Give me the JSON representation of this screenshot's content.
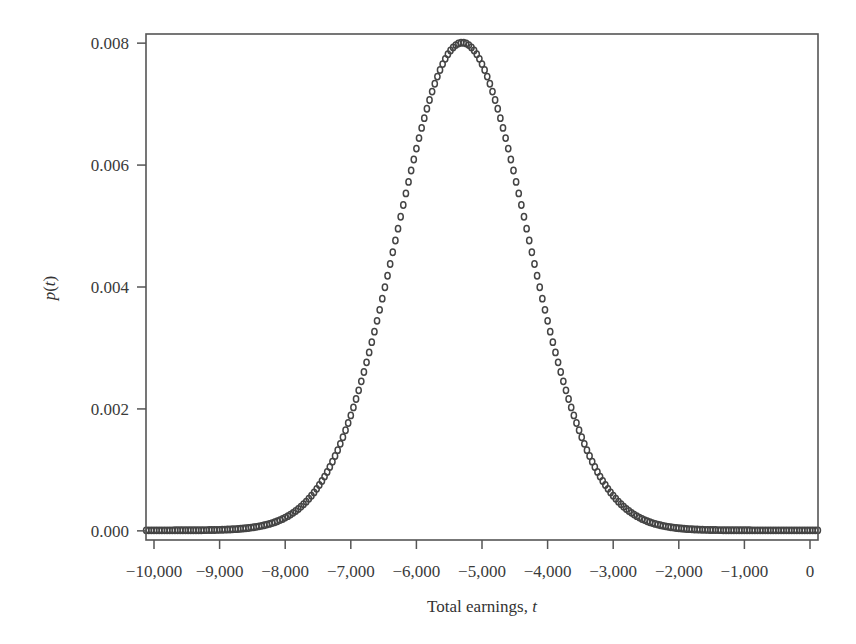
{
  "chart_data": {
    "type": "scatter",
    "title": "",
    "xlabel": "Total earnings, ",
    "xlabel_var": "t",
    "ylabel": "p(t)",
    "ylabel_parts": [
      "p",
      "(",
      "t",
      ")"
    ],
    "xlim": [
      -10122,
      122
    ],
    "ylim": [
      -0.00015,
      0.00815
    ],
    "x_ticks": [
      -10000,
      -9000,
      -8000,
      -7000,
      -6000,
      -5000,
      -4000,
      -3000,
      -2000,
      -1000,
      0
    ],
    "x_tick_labels": [
      "−10,000",
      "−9,000",
      "−8,000",
      "−7,000",
      "−6,000",
      "−5,000",
      "−4,000",
      "−3,000",
      "−2,000",
      "−1,000",
      "0"
    ],
    "y_ticks": [
      0.0,
      0.002,
      0.004,
      0.006,
      0.008
    ],
    "y_tick_labels": [
      "0.000",
      "0.002",
      "0.004",
      "0.006",
      "0.008"
    ],
    "grid": false,
    "legend": null,
    "marker": "open-circle",
    "marker_color": "#444444",
    "frame_color": "#555555",
    "distribution": {
      "shape": "gaussian",
      "mean": -5300,
      "sd": 1000,
      "peak": 0.008
    },
    "x": [
      -10100,
      -10050,
      -10000,
      -9950,
      -9900,
      -9850,
      -9800,
      -9750,
      -9700,
      -9650,
      -9600,
      -9550,
      -9500,
      -9450,
      -9400,
      -9350,
      -9300,
      -9250,
      -9200,
      -9150,
      -9100,
      -9050,
      -9000,
      -8950,
      -8900,
      -8850,
      -8800,
      -8750,
      -8700,
      -8650,
      -8600,
      -8550,
      -8500,
      -8450,
      -8400,
      -8350,
      -8300,
      -8250,
      -8200,
      -8150,
      -8100,
      -8050,
      -8000,
      -7950,
      -7900,
      -7850,
      -7800,
      -7750,
      -7700,
      -7650,
      -7600,
      -7550,
      -7500,
      -7450,
      -7400,
      -7350,
      -7300,
      -7250,
      -7200,
      -7150,
      -7100,
      -7050,
      -7000,
      -6950,
      -6900,
      -6850,
      -6800,
      -6750,
      -6700,
      -6650,
      -6600,
      -6550,
      -6500,
      -6450,
      -6400,
      -6350,
      -6300,
      -6250,
      -6200,
      -6150,
      -6100,
      -6050,
      -6000,
      -5950,
      -5900,
      -5850,
      -5800,
      -5750,
      -5700,
      -5650,
      -5600,
      -5550,
      -5500,
      -5450,
      -5400,
      -5350,
      -5300,
      -5250,
      -5200,
      -5150,
      -5100,
      -5050,
      -5000,
      -4950,
      -4900,
      -4850,
      -4800,
      -4750,
      -4700,
      -4650,
      -4600,
      -4550,
      -4500,
      -4450,
      -4400,
      -4350,
      -4300,
      -4250,
      -4200,
      -4150,
      -4100,
      -4050,
      -4000,
      -3950,
      -3900,
      -3850,
      -3800,
      -3750,
      -3700,
      -3650,
      -3600,
      -3550,
      -3500,
      -3450,
      -3400,
      -3350,
      -3300,
      -3250,
      -3200,
      -3150,
      -3100,
      -3050,
      -3000,
      -2950,
      -2900,
      -2850,
      -2800,
      -2750,
      -2700,
      -2650,
      -2600,
      -2550,
      -2500,
      -2450,
      -2400,
      -2350,
      -2300,
      -2250,
      -2200,
      -2150,
      -2100,
      -2050,
      -2000,
      -1950,
      -1900,
      -1850,
      -1800,
      -1750,
      -1700,
      -1650,
      -1600,
      -1550,
      -1500,
      -1450,
      -1400,
      -1350,
      -1300,
      -1250,
      -1200,
      -1150,
      -1100,
      -1050,
      -1000,
      -950,
      -900,
      -850,
      -800,
      -750,
      -700,
      -650,
      -600,
      -550,
      -500,
      -450,
      -400,
      -350,
      -300,
      -250,
      -200,
      -150,
      -100,
      -50,
      0,
      50,
      100
    ],
    "y": [
      0.0,
      0.0,
      0.0,
      0.0,
      0.0,
      0.0,
      0.0,
      0.0,
      0.0,
      0.0,
      0.0,
      1e-05,
      1e-05,
      1e-05,
      1e-05,
      1e-05,
      2e-05,
      2e-05,
      3e-05,
      4e-05,
      5e-05,
      6e-05,
      8e-05,
      0.0001,
      0.00012,
      0.00015,
      0.00018,
      0.00022,
      0.00027,
      0.00033,
      0.00039,
      0.00047,
      0.00056,
      0.00067,
      0.00079,
      0.00092,
      0.00108,
      0.00125,
      0.00145,
      0.00167,
      0.00192,
      0.00219,
      0.00249,
      0.00281,
      0.00316,
      0.00354,
      0.00395,
      0.00438,
      0.00483,
      0.00531,
      0.0058,
      0.00631,
      0.00683,
      0.00736,
      0.00789,
      0.00842,
      0.00894,
      0.00945,
      0.00994,
      0.01041,
      0.01084,
      0.01124,
      0.0116,
      0.01191,
      0.01217,
      0.01238,
      0.01253,
      0.01262,
      0.01264,
      0.0126,
      0.0125,
      0.01233,
      0.0121,
      0.01181,
      0.01147,
      0.01107,
      0.01063,
      0.01014,
      0.00961,
      0.00906,
      0.00847,
      0.00787,
      0.00725,
      0.00663,
      0.00601,
      0.0054,
      0.0048,
      0.00423,
      0.00369,
      0.00319,
      0.00272,
      0.00229,
      0.00191,
      0.00157,
      0.00127,
      0.00101,
      0.0008
    ],
    "y_note": "see rendered curve: p(t)=0.008*exp(-((t+5300)^2)/(2*1000^2))"
  }
}
